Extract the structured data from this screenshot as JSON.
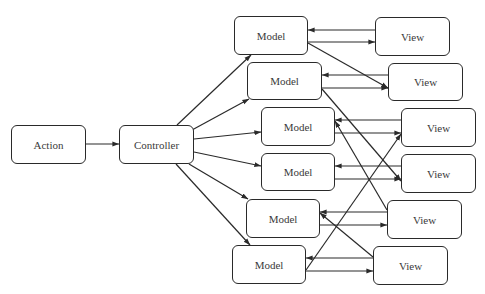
{
  "diagram": {
    "type": "flow",
    "nodes": [
      {
        "id": "action",
        "label": "Action",
        "x": 11,
        "y": 125,
        "w": 75,
        "h": 39
      },
      {
        "id": "controller",
        "label": "Controller",
        "x": 119,
        "y": 125,
        "w": 75,
        "h": 39
      },
      {
        "id": "model1",
        "label": "Model",
        "x": 234,
        "y": 16,
        "w": 74,
        "h": 39
      },
      {
        "id": "model2",
        "label": "Model",
        "x": 247,
        "y": 62,
        "w": 75,
        "h": 38
      },
      {
        "id": "model3",
        "label": "Model",
        "x": 261,
        "y": 107,
        "w": 74,
        "h": 39
      },
      {
        "id": "model4",
        "label": "Model",
        "x": 261,
        "y": 153,
        "w": 74,
        "h": 38
      },
      {
        "id": "model5",
        "label": "Model",
        "x": 246,
        "y": 199,
        "w": 74,
        "h": 39
      },
      {
        "id": "model6",
        "label": "Model",
        "x": 232,
        "y": 245,
        "w": 74,
        "h": 39
      },
      {
        "id": "view1",
        "label": "View",
        "x": 375,
        "y": 17,
        "w": 75,
        "h": 39
      },
      {
        "id": "view2",
        "label": "View",
        "x": 388,
        "y": 63,
        "w": 75,
        "h": 38
      },
      {
        "id": "view3",
        "label": "View",
        "x": 401,
        "y": 108,
        "w": 75,
        "h": 39
      },
      {
        "id": "view4",
        "label": "View",
        "x": 401,
        "y": 154,
        "w": 75,
        "h": 39
      },
      {
        "id": "view5",
        "label": "View",
        "x": 387,
        "y": 200,
        "w": 75,
        "h": 39
      },
      {
        "id": "view6",
        "label": "View",
        "x": 373,
        "y": 246,
        "w": 75,
        "h": 39
      }
    ],
    "edges": [
      {
        "from": "action",
        "to": "controller",
        "x1": 86,
        "y1": 144,
        "x2": 119,
        "y2": 144
      },
      {
        "from": "controller",
        "to": "model1",
        "x1": 177,
        "y1": 125,
        "x2": 251,
        "y2": 55
      },
      {
        "from": "controller",
        "to": "model2",
        "x1": 192,
        "y1": 130,
        "x2": 249,
        "y2": 99
      },
      {
        "from": "controller",
        "to": "model3",
        "x1": 194,
        "y1": 139,
        "x2": 261,
        "y2": 132
      },
      {
        "from": "controller",
        "to": "model4",
        "x1": 194,
        "y1": 152,
        "x2": 261,
        "y2": 166
      },
      {
        "from": "controller",
        "to": "model5",
        "x1": 189,
        "y1": 164,
        "x2": 248,
        "y2": 199
      },
      {
        "from": "controller",
        "to": "model6",
        "x1": 176,
        "y1": 164,
        "x2": 250,
        "y2": 245
      },
      {
        "from": "view1",
        "to": "model1",
        "x1": 375,
        "y1": 30,
        "x2": 308,
        "y2": 30
      },
      {
        "from": "model1",
        "to": "view1",
        "x1": 308,
        "y1": 42,
        "x2": 375,
        "y2": 42
      },
      {
        "from": "view2",
        "to": "model2",
        "x1": 388,
        "y1": 75,
        "x2": 322,
        "y2": 75
      },
      {
        "from": "model2",
        "to": "view2",
        "x1": 322,
        "y1": 88,
        "x2": 388,
        "y2": 88
      },
      {
        "from": "model1",
        "to": "view2",
        "x1": 308,
        "y1": 43,
        "x2": 388,
        "y2": 88
      },
      {
        "from": "view3",
        "to": "model3",
        "x1": 401,
        "y1": 120,
        "x2": 335,
        "y2": 120
      },
      {
        "from": "model3",
        "to": "view3",
        "x1": 335,
        "y1": 133,
        "x2": 401,
        "y2": 133
      },
      {
        "from": "view4",
        "to": "model4",
        "x1": 401,
        "y1": 166,
        "x2": 335,
        "y2": 166
      },
      {
        "from": "model4",
        "to": "view4",
        "x1": 335,
        "y1": 179,
        "x2": 401,
        "y2": 179
      },
      {
        "from": "model2",
        "to": "view4",
        "x1": 322,
        "y1": 89,
        "x2": 401,
        "y2": 181
      },
      {
        "from": "view5",
        "to": "model5",
        "x1": 387,
        "y1": 212,
        "x2": 320,
        "y2": 212
      },
      {
        "from": "model5",
        "to": "view5",
        "x1": 320,
        "y1": 225,
        "x2": 387,
        "y2": 225
      },
      {
        "from": "view5",
        "to": "model3",
        "x1": 387,
        "y1": 210,
        "x2": 335,
        "y2": 121
      },
      {
        "from": "view6",
        "to": "model6",
        "x1": 373,
        "y1": 258,
        "x2": 306,
        "y2": 258
      },
      {
        "from": "model6",
        "to": "view6",
        "x1": 306,
        "y1": 271,
        "x2": 373,
        "y2": 271
      },
      {
        "from": "model6",
        "to": "view3",
        "x1": 306,
        "y1": 270,
        "x2": 401,
        "y2": 134
      },
      {
        "from": "view6",
        "to": "model5",
        "x1": 373,
        "y1": 257,
        "x2": 320,
        "y2": 213
      }
    ],
    "colors": {
      "stroke": "#2a2a2a",
      "text": "#3a3a3a",
      "background": "#ffffff"
    }
  }
}
